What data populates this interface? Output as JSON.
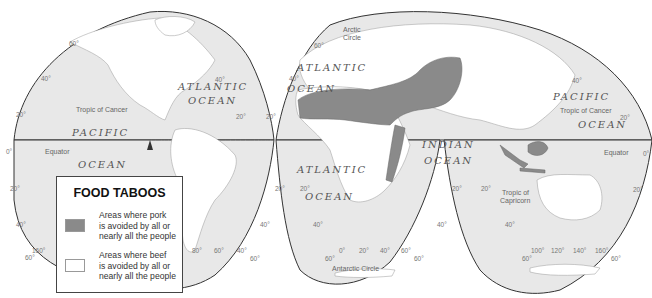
{
  "legend": {
    "title": "FOOD TABOOS",
    "items": [
      {
        "text_lines": [
          "Areas where pork",
          "is avoided by all or",
          "nearly all the people"
        ],
        "color": "#8a8a8a"
      },
      {
        "text_lines": [
          "Areas where beef",
          "is avoided by all or",
          "nearly all the people"
        ],
        "color": "#ffffff"
      }
    ]
  },
  "colors": {
    "ocean": "#e8e8e8",
    "land": "#ffffff",
    "pork_taboo": "#8a8a8a",
    "outline": "#333333"
  },
  "labels": {
    "oceans": {
      "pacific_west_1": "PACIFIC",
      "pacific_west_2": "OCEAN",
      "atlantic_north_1": "ATLANTIC",
      "atlantic_north_2": "OCEAN",
      "atlantic_north_east_1": "ATLANTIC",
      "atlantic_north_east_2": "OCEAN",
      "atlantic_south_1": "ATLANTIC",
      "atlantic_south_2": "OCEAN",
      "indian_1": "INDIAN",
      "indian_2": "OCEAN",
      "pacific_east_1": "PACIFIC",
      "pacific_east_2": "OCEAN"
    },
    "lines": {
      "tropic_cancer_west": "Tropic of Cancer",
      "tropic_cancer_east": "Tropic of Cancer",
      "equator_west": "Equator",
      "equator_east": "Equator",
      "tropic_capricorn_1": "Tropic of",
      "tropic_capricorn_2": "Capricorn",
      "arctic_circle_1": "Arctic",
      "arctic_circle_2": "Circle",
      "antarctic_circle": "Antarctic Circle"
    },
    "degrees": {
      "d60_nw": "60°",
      "d40_w": "40°",
      "d20_w": "20°",
      "d0_w": "0°",
      "d20s_w": "20°",
      "d40s_w": "40°",
      "d60s_w": "60°",
      "d160_w": "160°",
      "d40_atl": "40°",
      "d20_atl_l": "20°",
      "d20_atl_r": "20°",
      "d60_eur": "60°",
      "d40_eur": "40°",
      "d20_sa": "20°",
      "d40_sa": "40°",
      "d80_sa": "80°",
      "d60_sa": "60°",
      "d40_sa2": "40°",
      "d60_sa2": "60°",
      "d20_af_l": "20°",
      "d40_af": "40°",
      "d60_af_l": "60°",
      "d0_af": "0°",
      "d20_af": "20°",
      "d40_af2": "40°",
      "d60_af": "60°",
      "d60_af_r": "60°",
      "d20_ind_l": "20°",
      "d40_ind": "40°",
      "d20_ind_r": "20°",
      "d40_pac": "40°",
      "d20_pac": "20°",
      "d0_e": "0°",
      "d20s_e": "20°",
      "d40_aus": "40°",
      "d60_aus_l": "60°",
      "d100": "100°",
      "d120": "120°",
      "d140": "140°",
      "d160": "160°",
      "d60_aus_r": "60°"
    }
  }
}
